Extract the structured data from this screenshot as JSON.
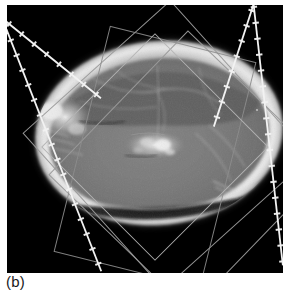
{
  "figure": {
    "caption": "(b)",
    "modality_label": "axial-head-ct-slice",
    "background_color": "#000000",
    "page_color": "#ffffff",
    "frame": {
      "x": 7,
      "y": 5,
      "width": 276,
      "height": 268
    }
  },
  "palette": {
    "black": "#000000",
    "skull_bright": "#ededed",
    "skull_mid": "#c9c9c9",
    "brain_tissue": "#7c7c7c",
    "brain_dark": "#5a5a5a",
    "overlay_line": "#f2f2f2",
    "roi_outline": "#9a9a9a",
    "roi_outline_faint": "#808080",
    "caption_text": "#1a1a1a"
  },
  "anatomy": {
    "name": "skull-cross-section",
    "outer_ellipse": {
      "cx": 152,
      "cy": 128,
      "rx": 124,
      "ry": 92,
      "rotation_deg": -6
    },
    "inner_ellipse": {
      "cx": 152,
      "cy": 130,
      "rx": 108,
      "ry": 76,
      "rotation_deg": -6
    },
    "bright_rim_thickness": 7,
    "description": "axial cranial slice with bright cortical bone rim and mid-gray intracranial contents"
  },
  "overlay_lines": [
    {
      "name": "measurement-line-descending",
      "x1": 2,
      "y1": 18,
      "x2": 100,
      "y2": 268,
      "tick_count": 17,
      "tick_length": 6,
      "color": "#f2f2f2",
      "width": 1.6,
      "style": "ticked-dashed"
    },
    {
      "name": "measurement-line-ascending",
      "x1": 247,
      "y1": 0,
      "x2": 276,
      "y2": 258,
      "tick_count": 17,
      "tick_length": 6,
      "color": "#f2f2f2",
      "width": 1.6,
      "style": "ticked-dashed",
      "note": "drawn as two linked segments meeting near slice center"
    }
  ],
  "roi_shapes": [
    {
      "name": "roi-rect-upper-left",
      "type": "rotated-rectangle",
      "cx": 160,
      "cy": 140,
      "width": 198,
      "height": 210,
      "rotation_deg": -42,
      "stroke": "#9a9a9a",
      "stroke_width": 1
    },
    {
      "name": "roi-rect-lower-right",
      "type": "rotated-rectangle",
      "cx": 182,
      "cy": 166,
      "width": 196,
      "height": 200,
      "rotation_deg": 44,
      "stroke": "#9a9a9a",
      "stroke_width": 1
    },
    {
      "name": "roi-rect-center-tall",
      "type": "rotated-rectangle",
      "cx": 148,
      "cy": 152,
      "width": 150,
      "height": 232,
      "rotation_deg": 14,
      "stroke": "#8d8d8d",
      "stroke_width": 1
    },
    {
      "name": "roi-diamond-center",
      "type": "rotated-square",
      "cx": 148,
      "cy": 142,
      "size": 160,
      "rotation_deg": 45,
      "stroke": "#b0b0b0",
      "stroke_width": 1
    }
  ],
  "internal_markings": {
    "name": "intracranial-structures",
    "items": [
      {
        "name": "falx-cerebri-line",
        "kind": "curve"
      },
      {
        "name": "lateral-ventricle-cluster",
        "kind": "bright-speckle"
      },
      {
        "name": "frontal-sinus-bright-spot",
        "kind": "bright-blob"
      },
      {
        "name": "posterior-dark-band",
        "kind": "dark-arc"
      }
    ]
  }
}
